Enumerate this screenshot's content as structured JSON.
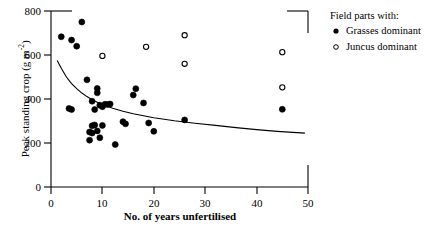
{
  "chart_data": {
    "type": "scatter",
    "title": "",
    "xlabel": "No. of years unfertilised",
    "ylabel": "Peak standing crop (g m-2)",
    "ylabel_main": "Peak standing crop (g m",
    "ylabel_exp": "-2",
    "ylabel_tail": ")",
    "xlim": [
      0,
      50
    ],
    "ylim": [
      0,
      800
    ],
    "xticks": [
      "0",
      "10",
      "20",
      "30",
      "40",
      "50"
    ],
    "xtick_values": [
      0,
      10,
      20,
      30,
      40,
      50
    ],
    "yticks": [
      "0",
      "200",
      "400",
      "600",
      "800"
    ],
    "ytick_values": [
      0,
      200,
      400,
      600,
      800
    ],
    "grid": false,
    "series": [
      {
        "name": "Grasses dominant",
        "marker": "filled-circle",
        "color": "#000000",
        "points": [
          [
            2,
            683
          ],
          [
            4,
            668
          ],
          [
            4,
            352
          ],
          [
            3.5,
            357
          ],
          [
            5,
            640
          ],
          [
            6,
            750
          ],
          [
            7,
            487
          ],
          [
            8,
            390
          ],
          [
            8.5,
            352
          ],
          [
            9,
            428
          ],
          [
            9,
            448
          ],
          [
            9.5,
            372
          ],
          [
            10,
            365
          ],
          [
            10.5,
            376
          ],
          [
            11,
            375
          ],
          [
            11.5,
            377
          ],
          [
            8,
            278
          ],
          [
            8.5,
            282
          ],
          [
            7.5,
            250
          ],
          [
            8,
            245
          ],
          [
            7.5,
            213
          ],
          [
            9,
            255
          ],
          [
            9.5,
            224
          ],
          [
            10,
            280
          ],
          [
            12.5,
            193
          ],
          [
            14,
            297
          ],
          [
            14.5,
            287
          ],
          [
            16,
            418
          ],
          [
            16.5,
            447
          ],
          [
            18,
            382
          ],
          [
            19,
            291
          ],
          [
            20,
            253
          ],
          [
            26,
            305
          ],
          [
            45,
            353
          ]
        ]
      },
      {
        "name": "Juncus dominant",
        "marker": "open-circle",
        "color": "#000000",
        "points": [
          [
            10,
            596
          ],
          [
            18.5,
            637
          ],
          [
            26,
            690
          ],
          [
            26,
            560
          ],
          [
            45,
            613
          ],
          [
            45,
            453
          ]
        ]
      }
    ],
    "fit_curve": {
      "name": "fitted decay curve",
      "points": [
        [
          1.2,
          575
        ],
        [
          2,
          540
        ],
        [
          3,
          500
        ],
        [
          4,
          470
        ],
        [
          5,
          447
        ],
        [
          6,
          427
        ],
        [
          7,
          411
        ],
        [
          8,
          397
        ],
        [
          9,
          385
        ],
        [
          10,
          375
        ],
        [
          12,
          358
        ],
        [
          14,
          344
        ],
        [
          16,
          333
        ],
        [
          18,
          324
        ],
        [
          20,
          315
        ],
        [
          24,
          301
        ],
        [
          28,
          290
        ],
        [
          32,
          280
        ],
        [
          36,
          270
        ],
        [
          40,
          261
        ],
        [
          44,
          253
        ],
        [
          49.4,
          245
        ]
      ]
    }
  },
  "legend": {
    "title": "Field parts with:",
    "entries": [
      {
        "label": "Grasses dominant",
        "marker": "filled-circle"
      },
      {
        "label": "Juncus dominant",
        "marker": "open-circle"
      }
    ]
  }
}
